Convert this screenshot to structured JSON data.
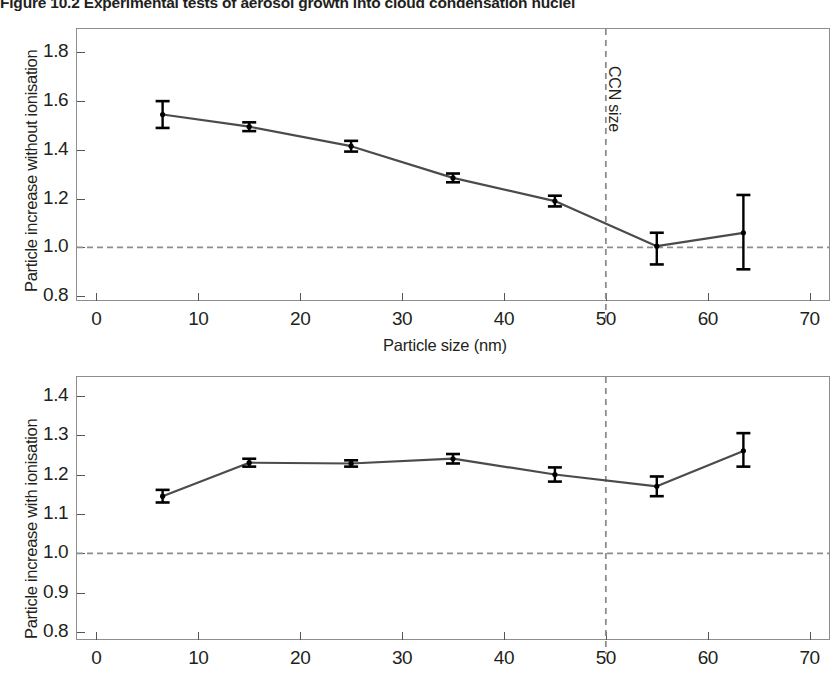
{
  "figure": {
    "label": "Figure 10.2",
    "caption": "Experimental tests of aerosol growth into cloud condensation nuclei",
    "full_title": "Figure 10.2  Experimental tests of aerosol growth into cloud condensation nuclei"
  },
  "colors": {
    "ink": "#231f20",
    "frame": "#8d8d8d",
    "series_line": "#4b4b4b",
    "marker": "#000000",
    "reference_line": "#8d8d8d",
    "ccn_line": "#8d8d8d"
  },
  "chart_data": [
    {
      "id": "without-ionisation",
      "type": "line",
      "title": "",
      "xlabel": "Particle size (nm)",
      "ylabel": "Particle increase without ionisation",
      "xlim": [
        -2.0,
        72.0
      ],
      "ylim": [
        0.78,
        1.9
      ],
      "xticks": [
        0,
        10,
        20,
        30,
        40,
        50,
        60,
        70
      ],
      "xtick_labels": [
        "0",
        "10",
        "20",
        "30",
        "40",
        "50",
        "60",
        "70"
      ],
      "yticks": [
        0.8,
        1.0,
        1.2,
        1.4,
        1.6,
        1.8
      ],
      "ytick_labels": [
        "0.8",
        "1.0",
        "1.2",
        "1.4",
        "1.6",
        "1.8"
      ],
      "grid": false,
      "legend": "none",
      "x": [
        6.5,
        15.0,
        25.0,
        35.0,
        45.0,
        55.0,
        63.5
      ],
      "values": [
        1.545,
        1.495,
        1.415,
        1.285,
        1.19,
        1.005,
        1.06
      ],
      "err_lower": [
        0.055,
        0.018,
        0.022,
        0.018,
        0.022,
        0.075,
        0.15
      ],
      "err_upper": [
        0.055,
        0.018,
        0.022,
        0.018,
        0.022,
        0.055,
        0.155
      ],
      "reference_line": {
        "y": 1.0,
        "style": "dashed"
      },
      "annotations": [
        {
          "text": "CCN size",
          "x": 50,
          "style": "vertical-dashed-line",
          "rotation": 90
        }
      ]
    },
    {
      "id": "with-ionisation",
      "type": "line",
      "title": "",
      "xlabel": "",
      "ylabel": "Particle increase with ionisation",
      "xlim": [
        -2.0,
        72.0
      ],
      "ylim": [
        0.78,
        1.45
      ],
      "xticks": [
        0,
        10,
        20,
        30,
        40,
        50,
        60,
        70
      ],
      "xtick_labels": [
        "0",
        "10",
        "20",
        "30",
        "40",
        "50",
        "60",
        "70"
      ],
      "yticks": [
        0.8,
        0.9,
        1.0,
        1.1,
        1.2,
        1.3,
        1.4
      ],
      "ytick_labels": [
        "0.8",
        "0.9",
        "1.0",
        "1.1",
        "1.2",
        "1.3",
        "1.4"
      ],
      "grid": false,
      "legend": "none",
      "x": [
        6.5,
        15.0,
        25.0,
        35.0,
        45.0,
        55.0,
        63.5
      ],
      "values": [
        1.145,
        1.23,
        1.228,
        1.24,
        1.2,
        1.17,
        1.26
      ],
      "err_lower": [
        0.016,
        0.01,
        0.008,
        0.012,
        0.018,
        0.025,
        0.04
      ],
      "err_upper": [
        0.016,
        0.01,
        0.008,
        0.012,
        0.018,
        0.025,
        0.045
      ],
      "reference_line": {
        "y": 1.0,
        "style": "dashed"
      },
      "annotations": [
        {
          "text": "",
          "x": 50,
          "style": "vertical-dashed-line",
          "rotation": 90
        }
      ]
    }
  ]
}
